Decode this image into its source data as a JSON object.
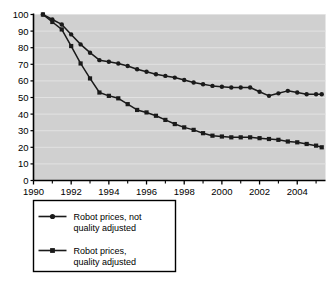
{
  "chart_data": {
    "type": "line",
    "title": "",
    "subtitle": "",
    "xlabel": "",
    "ylabel": "",
    "xlim": [
      1990,
      2005.5
    ],
    "ylim": [
      0,
      100
    ],
    "grid": true,
    "grid_axis": "y",
    "legend_position": "below-left",
    "plot_background": "#d0d0d0",
    "line_color": "#1a1a1a",
    "grid_color": "#e2e2e2",
    "axis_color": "#000000",
    "y_ticks": [
      0,
      10,
      20,
      30,
      40,
      50,
      60,
      70,
      80,
      90,
      100
    ],
    "y_tick_labels": [
      "0",
      "10",
      "20",
      "30",
      "40",
      "50",
      "60",
      "70",
      "80",
      "90",
      "100"
    ],
    "x_ticks_major": [
      1990,
      1992,
      1994,
      1996,
      1998,
      2000,
      2002,
      2004
    ],
    "x_tick_labels": [
      "1990",
      "1992",
      "1994",
      "1996",
      "1998",
      "2000",
      "2002",
      "2004"
    ],
    "x_ticks_minor": [
      1991,
      1993,
      1995,
      1997,
      1999,
      2001,
      2003,
      2005
    ],
    "x": [
      1990.5,
      1991.0,
      1991.5,
      1992.0,
      1992.5,
      1993.0,
      1993.5,
      1994.0,
      1994.5,
      1995.0,
      1995.5,
      1996.0,
      1996.5,
      1997.0,
      1997.5,
      1998.0,
      1998.5,
      1999.0,
      1999.5,
      2000.0,
      2000.5,
      2001.0,
      2001.5,
      2002.0,
      2002.5,
      2003.0,
      2003.5,
      2004.0,
      2004.5,
      2005.0,
      2005.3
    ],
    "series": [
      {
        "name": "Robot prices, not quality adjusted",
        "marker": "circle",
        "values": [
          100,
          97,
          94,
          88,
          82,
          77,
          72.5,
          71.5,
          70.5,
          69,
          67,
          65.5,
          64,
          63,
          62,
          60.5,
          59,
          58,
          57,
          56.5,
          56,
          56,
          56,
          53.5,
          51,
          52.5,
          54,
          53,
          52,
          52,
          52
        ]
      },
      {
        "name": "Robot prices, quality adjusted",
        "marker": "square",
        "values": [
          100,
          95.5,
          91,
          81,
          70.5,
          61.5,
          53,
          51,
          49.5,
          46,
          42.5,
          41,
          39,
          36.5,
          34,
          32,
          30.5,
          28.5,
          27,
          26.5,
          26,
          26,
          26,
          25.5,
          25,
          24.5,
          23.5,
          23,
          22,
          21,
          20
        ]
      }
    ]
  },
  "legend": {
    "items": [
      {
        "label_line1": "Robot prices, not",
        "label_line2": "quality adjusted",
        "marker": "circle"
      },
      {
        "label_line1": "Robot prices,",
        "label_line2": "quality adjusted",
        "marker": "square"
      }
    ]
  }
}
